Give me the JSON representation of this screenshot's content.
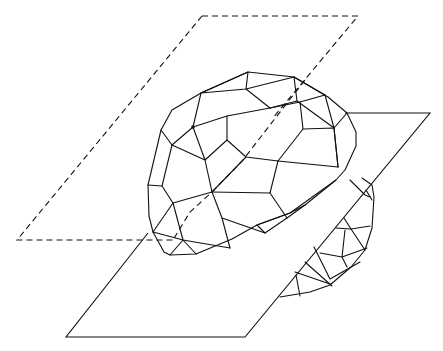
{
  "figure": {
    "description": "Line drawing of a faceted polyhedral sphere intersected by two parallel planes",
    "line_color": "#111111",
    "background": "#ffffff",
    "dashed_plane": {
      "label": "upper cutting plane (hidden/dashed)",
      "corners": [
        [
          202,
          16
        ],
        [
          358,
          16
        ],
        [
          175,
          240
        ],
        [
          17,
          240
        ]
      ]
    },
    "solid_plane": {
      "label": "lower cutting plane (solid)",
      "corners": [
        [
          345,
          113
        ],
        [
          430,
          113
        ],
        [
          245,
          337
        ],
        [
          66,
          337
        ]
      ]
    },
    "polyhedron": {
      "label": "faceted sphere (geodesic polyhedron)",
      "marked_vertex": [
        193,
        127
      ]
    }
  }
}
